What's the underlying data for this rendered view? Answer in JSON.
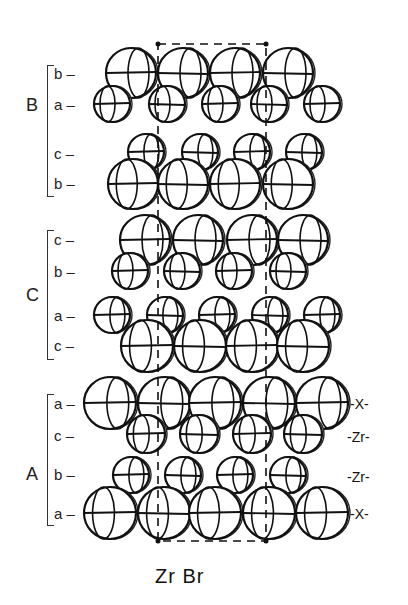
{
  "figure": {
    "caption": "Zr Br",
    "groups": [
      {
        "label": "B",
        "layers": [
          "b",
          "a",
          "c",
          "b"
        ]
      },
      {
        "label": "C",
        "layers": [
          "c",
          "b",
          "a",
          "c"
        ]
      },
      {
        "label": "A",
        "layers": [
          "a",
          "c",
          "b",
          "a"
        ]
      }
    ],
    "right_labels": [
      "-X-",
      "-Zr-",
      "-Zr-",
      "-X-"
    ],
    "atom_rows": [
      {
        "layer": "b",
        "y": 73,
        "r": 25,
        "xs": [
          131,
          183,
          235,
          288
        ]
      },
      {
        "layer": "a",
        "y": 104,
        "r": 18,
        "xs": [
          112,
          167,
          220,
          269,
          322
        ]
      },
      {
        "layer": "c",
        "y": 152,
        "r": 18,
        "xs": [
          146,
          200,
          252,
          304
        ]
      },
      {
        "layer": "b",
        "y": 184,
        "r": 25,
        "xs": [
          133,
          183,
          235,
          288
        ]
      },
      {
        "layer": "c",
        "y": 240,
        "r": 25,
        "xs": [
          145,
          198,
          252,
          303
        ]
      },
      {
        "layer": "b",
        "y": 271,
        "r": 18,
        "xs": [
          130,
          182,
          234,
          288
        ]
      },
      {
        "layer": "a",
        "y": 315,
        "r": 18,
        "xs": [
          112,
          165,
          217,
          270,
          322
        ]
      },
      {
        "layer": "c",
        "y": 346,
        "r": 26,
        "xs": [
          147,
          200,
          252,
          303
        ]
      },
      {
        "layer": "a",
        "y": 403,
        "r": 26,
        "xs": [
          110,
          164,
          215,
          269,
          322
        ]
      },
      {
        "layer": "c",
        "y": 434,
        "r": 19,
        "xs": [
          146,
          199,
          252,
          303
        ]
      },
      {
        "layer": "b",
        "y": 475,
        "r": 18,
        "xs": [
          131,
          183,
          235,
          288
        ]
      },
      {
        "layer": "a",
        "y": 513,
        "r": 26,
        "xs": [
          110,
          164,
          215,
          269,
          322
        ]
      }
    ],
    "unit_cell": {
      "x1": 158,
      "x2": 266,
      "y1": 44,
      "y2": 541
    }
  }
}
